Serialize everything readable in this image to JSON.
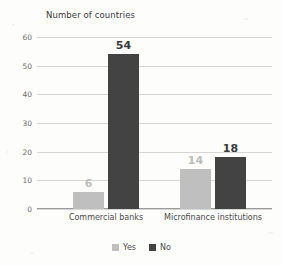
{
  "chart_data": {
    "type": "bar",
    "title": "Number of countries",
    "xlabel": "",
    "ylabel": "",
    "categories": [
      "Commercial banks",
      "Microfinance institutions"
    ],
    "series": [
      {
        "name": "Yes",
        "values": [
          6,
          14
        ],
        "color": "#bfbfbf"
      },
      {
        "name": "No",
        "values": [
          54,
          18
        ],
        "color": "#434343"
      }
    ],
    "ylim": [
      0,
      60
    ],
    "yticks": [
      0,
      10,
      20,
      30,
      40,
      50,
      60
    ],
    "ytick_labels": [
      "0",
      "10",
      "20",
      "30",
      "40",
      "50",
      "60"
    ],
    "grid": true,
    "legend_position": "bottom",
    "data_labels": [
      "6",
      "54",
      "14",
      "18"
    ]
  }
}
